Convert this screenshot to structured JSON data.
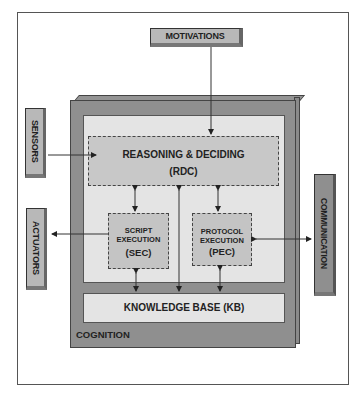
{
  "diagram": {
    "external": {
      "motivations": "MOTIVATIONS",
      "sensors": "SENSORS",
      "actuators": "ACTUATORS",
      "communication": "COMMUNICATION"
    },
    "cognition": {
      "label": "COGNITION",
      "rdc": {
        "title": "REASONING & DECIDING",
        "abbr": "(RDC)"
      },
      "sec": {
        "line1": "SCRIPT",
        "line2": "EXECUTION",
        "abbr": "(SEC)"
      },
      "pec": {
        "line1": "PROTOCOL",
        "line2": "EXECUTION",
        "abbr": "(PEC)"
      },
      "kb": {
        "title": "KNOWLEDGE BASE (KB)"
      }
    },
    "connections": [
      {
        "from": "MOTIVATIONS",
        "to": "RDC",
        "type": "one-way"
      },
      {
        "from": "SENSORS",
        "to": "RDC",
        "type": "one-way"
      },
      {
        "from": "SEC",
        "to": "ACTUATORS",
        "type": "one-way"
      },
      {
        "from": "PEC",
        "to": "COMMUNICATION",
        "type": "two-way"
      },
      {
        "from": "RDC",
        "to": "SEC",
        "type": "two-way"
      },
      {
        "from": "RDC",
        "to": "PEC",
        "type": "two-way"
      },
      {
        "from": "RDC",
        "to": "KB",
        "type": "two-way"
      },
      {
        "from": "SEC",
        "to": "KB",
        "type": "two-way"
      },
      {
        "from": "PEC",
        "to": "KB",
        "type": "two-way"
      }
    ],
    "colors": {
      "cognition_outer": "#8f8f8f",
      "inner_panel": "#e4e4e4",
      "module_fill": "#c4c4c4",
      "line": "#333333"
    }
  }
}
